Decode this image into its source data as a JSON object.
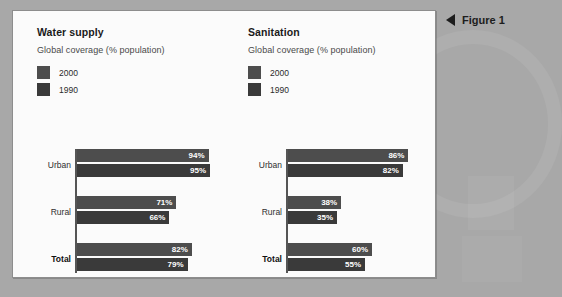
{
  "figure": {
    "caption": "Figure 1",
    "caption_arrow_icon": "triangle-left-icon"
  },
  "colors": {
    "background": "#a8a8a8",
    "panel": "#fbfbfb",
    "series_2000": "#4d4d4d",
    "series_1990": "#3a3a3a",
    "axis": "#555555",
    "value_label": "#ffffff"
  },
  "charts": [
    {
      "title": "Water supply",
      "subtitle": "Global coverage (% population)",
      "legend": [
        {
          "label": "2000",
          "color": "#4d4d4d"
        },
        {
          "label": "1990",
          "color": "#3a3a3a"
        }
      ],
      "groups": [
        {
          "label": "Urban",
          "bold": false,
          "values": [
            {
              "series": "2000",
              "value": 94,
              "text": "94%"
            },
            {
              "series": "1990",
              "value": 95,
              "text": "95%"
            }
          ]
        },
        {
          "label": "Rural",
          "bold": false,
          "values": [
            {
              "series": "2000",
              "value": 71,
              "text": "71%"
            },
            {
              "series": "1990",
              "value": 66,
              "text": "66%"
            }
          ]
        },
        {
          "label": "Total",
          "bold": true,
          "values": [
            {
              "series": "2000",
              "value": 82,
              "text": "82%"
            },
            {
              "series": "1990",
              "value": 79,
              "text": "79%"
            }
          ]
        }
      ]
    },
    {
      "title": "Sanitation",
      "subtitle": "Global coverage (% population)",
      "legend": [
        {
          "label": "2000",
          "color": "#4d4d4d"
        },
        {
          "label": "1990",
          "color": "#3a3a3a"
        }
      ],
      "groups": [
        {
          "label": "Urban",
          "bold": false,
          "values": [
            {
              "series": "2000",
              "value": 86,
              "text": "86%"
            },
            {
              "series": "1990",
              "value": 82,
              "text": "82%"
            }
          ]
        },
        {
          "label": "Rural",
          "bold": false,
          "values": [
            {
              "series": "2000",
              "value": 38,
              "text": "38%"
            },
            {
              "series": "1990",
              "value": 35,
              "text": "35%"
            }
          ]
        },
        {
          "label": "Total",
          "bold": true,
          "values": [
            {
              "series": "2000",
              "value": 60,
              "text": "60%"
            },
            {
              "series": "1990",
              "value": 55,
              "text": "55%"
            }
          ]
        }
      ]
    }
  ],
  "chart_data": [
    {
      "type": "bar",
      "orientation": "horizontal",
      "title": "Water supply",
      "subtitle": "Global coverage (% population)",
      "xlabel": "",
      "ylabel": "",
      "categories": [
        "Urban",
        "Rural",
        "Total"
      ],
      "series": [
        {
          "name": "2000",
          "values": [
            94,
            71,
            82
          ],
          "color": "#4d4d4d"
        },
        {
          "name": "1990",
          "values": [
            95,
            66,
            79
          ],
          "color": "#3a3a3a"
        }
      ],
      "data_labels": [
        [
          "94%",
          "71%",
          "82%"
        ],
        [
          "95%",
          "66%",
          "79%"
        ]
      ],
      "xlim": [
        0,
        100
      ],
      "grid": false,
      "legend_position": "top-left"
    },
    {
      "type": "bar",
      "orientation": "horizontal",
      "title": "Sanitation",
      "subtitle": "Global coverage (% population)",
      "xlabel": "",
      "ylabel": "",
      "categories": [
        "Urban",
        "Rural",
        "Total"
      ],
      "series": [
        {
          "name": "2000",
          "values": [
            86,
            38,
            60
          ],
          "color": "#4d4d4d"
        },
        {
          "name": "1990",
          "values": [
            82,
            35,
            55
          ],
          "color": "#3a3a3a"
        }
      ],
      "data_labels": [
        [
          "86%",
          "38%",
          "60%"
        ],
        [
          "82%",
          "35%",
          "55%"
        ]
      ],
      "xlim": [
        0,
        100
      ],
      "grid": false,
      "legend_position": "top-left"
    }
  ]
}
